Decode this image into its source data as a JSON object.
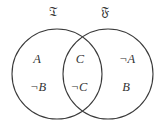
{
  "diagram": {
    "type": "venn",
    "sets": [
      {
        "id": "left",
        "label": "𝔗",
        "cx": 57,
        "cy": 74,
        "r": 45
      },
      {
        "id": "right",
        "label": "𝔉",
        "cx": 108,
        "cy": 74,
        "r": 45
      }
    ],
    "regions": {
      "left_only": [
        "A",
        "¬B"
      ],
      "intersection": [
        "C",
        "¬C"
      ],
      "right_only": [
        "¬A",
        "B"
      ]
    },
    "colors": {
      "stroke": "#3a3a3a",
      "text": "#333333",
      "background": "#ffffff"
    }
  }
}
